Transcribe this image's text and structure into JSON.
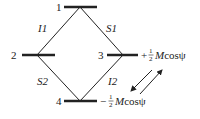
{
  "diagram": {
    "levels": [
      {
        "id": "level-1",
        "label": "1"
      },
      {
        "id": "level-2",
        "label": "2"
      },
      {
        "id": "level-3",
        "label": "3",
        "energy": "Mcosψ",
        "sign": "+"
      },
      {
        "id": "level-4",
        "label": "4",
        "energy": "Mcosψ",
        "sign": "−"
      }
    ],
    "transitions": [
      {
        "label": "I1",
        "from": "1",
        "to": "2"
      },
      {
        "label": "S1",
        "from": "1",
        "to": "3"
      },
      {
        "label": "S2",
        "from": "2",
        "to": "4"
      },
      {
        "label": "I2",
        "from": "3",
        "to": "4"
      }
    ],
    "fraction": {
      "num": "1",
      "den": "2"
    },
    "colors": {
      "line": "#222222",
      "background": "#ffffff"
    }
  }
}
